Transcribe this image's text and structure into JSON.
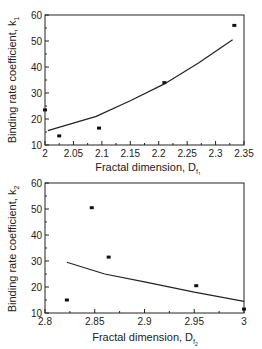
{
  "chart_data": [
    {
      "type": "scatter",
      "title": "",
      "xlabel": "Fractal dimension, D_f1",
      "ylabel": "Binding rate coefficient, k1",
      "xlabel_main": "Fractal dimension, D",
      "xlabel_sub": "f",
      "xlabel_subsub": "1",
      "ylabel_main": "Binding rate coefficient, k",
      "ylabel_sub": "1",
      "xlim": [
        2,
        2.35
      ],
      "ylim": [
        10,
        60
      ],
      "xticks": [
        "2",
        "2.05",
        "2.1",
        "2.15",
        "2.2",
        "2.25",
        "2.3",
        "2.35"
      ],
      "yticks": [
        "10",
        "20",
        "30",
        "40",
        "50",
        "60"
      ],
      "grid": false,
      "series": [
        {
          "name": "data",
          "kind": "points",
          "x": [
            2.0,
            2.025,
            2.095,
            2.21,
            2.333
          ],
          "y": [
            23.5,
            13.5,
            16.5,
            34,
            56
          ]
        },
        {
          "name": "fit",
          "kind": "line",
          "x": [
            2.005,
            2.09,
            2.15,
            2.21,
            2.27,
            2.33
          ],
          "y": [
            15.5,
            21,
            27,
            33.5,
            41.5,
            50.5
          ]
        }
      ]
    },
    {
      "type": "scatter",
      "title": "",
      "xlabel": "Fractal dimension, D_f2",
      "ylabel": "Binding rate coefficient, k2",
      "xlabel_main": "Fractal dimension, D",
      "xlabel_sub": "f",
      "xlabel_subsub": "2",
      "ylabel_main": "Binding rate coefficient, k",
      "ylabel_sub": "2",
      "xlim": [
        2.8,
        3.0
      ],
      "ylim": [
        10,
        60
      ],
      "xticks": [
        "2.8",
        "2.85",
        "2.9",
        "2.95",
        "3"
      ],
      "yticks": [
        "10",
        "20",
        "30",
        "40",
        "50",
        "60"
      ],
      "grid": false,
      "series": [
        {
          "name": "data",
          "kind": "points",
          "x": [
            2.822,
            2.847,
            2.864,
            2.952,
            3.0
          ],
          "y": [
            15,
            50.5,
            31.5,
            20.5,
            11.5
          ]
        },
        {
          "name": "fit",
          "kind": "line",
          "x": [
            2.822,
            2.86,
            2.9,
            2.95,
            3.0
          ],
          "y": [
            29.5,
            25,
            22,
            18,
            14.5
          ]
        }
      ]
    }
  ]
}
